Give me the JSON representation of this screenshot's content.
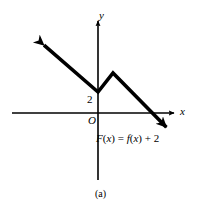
{
  "figure": {
    "caption": "(a)",
    "background_color": "#ffffff",
    "ink_color": "#000000"
  },
  "axes": {
    "x_label": "x",
    "y_label": "y",
    "origin_label": "O"
  },
  "annotations": {
    "y_intercept_value": "2",
    "function_label_parts": {
      "F": "F",
      "open1": "(",
      "x1": "x",
      "close1": ")",
      "equals": " = ",
      "f": "f",
      "open2": "(",
      "x2": "x",
      "close2": ")",
      "plus_two": " + 2"
    },
    "function_label_text": "F(x) = f(x) + 2"
  },
  "chart_data": {
    "type": "line",
    "title": "",
    "subtitle": "(a)",
    "xlabel": "x",
    "ylabel": "y",
    "grid": false,
    "legend": null,
    "annotations": [
      {
        "text": "2",
        "x": -0.35,
        "y": 2.0,
        "note": "y-intercept value marked on y-axis"
      },
      {
        "text": "O",
        "x": -0.35,
        "y": -0.45,
        "note": "origin label"
      },
      {
        "text": "F(x) = f(x) + 2",
        "x": 0.4,
        "y": -1.6,
        "note": "curve equation label"
      }
    ],
    "axis_pixel_geometry": {
      "origin_px": [
        98,
        113
      ],
      "x_axis_px": [
        [
          12,
          113
        ],
        [
          176,
          113
        ]
      ],
      "y_axis_px": [
        [
          98,
          180
        ],
        [
          98,
          18
        ]
      ],
      "x_arrow_at_px": [
        176,
        113
      ],
      "y_arrow_at_px": [
        98,
        18
      ],
      "units_per_px_x": 0.0694,
      "units_per_px_y": 0.0694
    },
    "series": [
      {
        "name": "F(x) = f(x) + 2",
        "style": "piecewise-linear, thick black, arrowheads on both ends",
        "arrow_start": true,
        "arrow_end": true,
        "points_px": [
          [
            38,
            40
          ],
          [
            98,
            92
          ],
          [
            113,
            73
          ],
          [
            172,
            133
          ]
        ],
        "points": [
          [
            -4.16,
            5.07
          ],
          [
            0.0,
            1.46
          ],
          [
            1.04,
            2.78
          ],
          [
            5.14,
            -1.39
          ]
        ],
        "vertices_description": [
          "upper-left arrow tip going up-left off-plot",
          "local minimum on the y-axis at y = 2",
          "local maximum (corner peak) right of the y-axis",
          "lower-right arrow tip descending below the x-axis"
        ]
      }
    ],
    "xlim": [
      -6.2,
      7.2
    ],
    "ylim": [
      -4.7,
      6.6
    ]
  }
}
